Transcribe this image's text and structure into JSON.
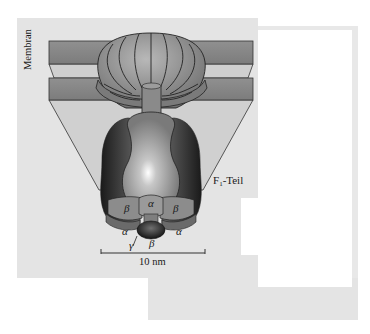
{
  "figure": {
    "type": "ATP-Synthase schematic (F0/F1 complex in membrane)",
    "labels": {
      "membrane": "Membran",
      "f1_part_prefix": "F",
      "f1_part_sub": "1",
      "f1_part_suffix": "-Teil",
      "scale_bar": "10 nm"
    },
    "subunits": [
      {
        "symbol": "β",
        "position": "left-upper"
      },
      {
        "symbol": "α",
        "position": "center-upper"
      },
      {
        "symbol": "β",
        "position": "right-upper"
      },
      {
        "symbol": "α",
        "position": "left-lower"
      },
      {
        "symbol": "γ",
        "position": "center-left-lower"
      },
      {
        "symbol": "β",
        "position": "center-lower"
      },
      {
        "symbol": "α",
        "position": "right-lower"
      }
    ],
    "colors": {
      "panel_bg": "#e4e4e4",
      "membrane_slab": "#8a8a8a",
      "membrane_bevel": "#c8c8c8",
      "protein_dark": "#2a2a2a",
      "protein_mid": "#8e8e8e",
      "protein_light": "#d8d8d8"
    }
  }
}
